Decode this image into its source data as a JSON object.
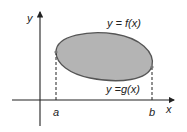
{
  "diagram": {
    "type": "area-between-curves",
    "axes": {
      "x_label": "x",
      "y_label": "y"
    },
    "upper_curve_label": "y = f(x)",
    "lower_curve_label": "y =g(x)",
    "bounds": {
      "left": "a",
      "right": "b"
    },
    "colors": {
      "region_fill": "#b4b4b4",
      "curve_stroke": "#555555",
      "axis": "#222222"
    }
  }
}
